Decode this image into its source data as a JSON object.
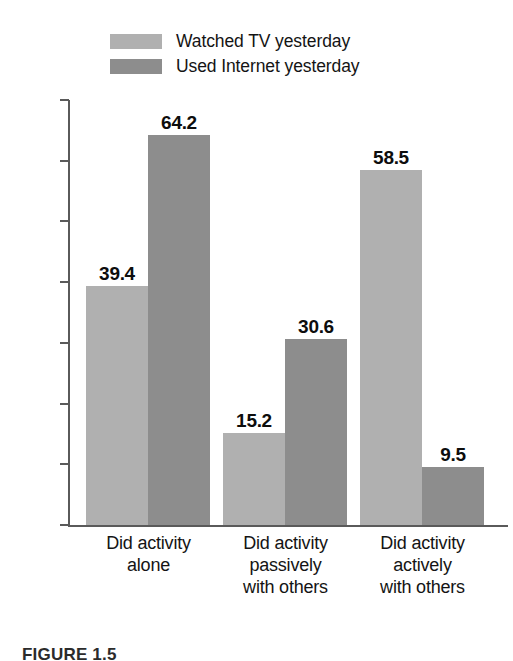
{
  "chart_data": {
    "type": "bar",
    "title": "",
    "subtitle": "",
    "xlabel": "",
    "ylabel": "",
    "ylim": [
      0,
      70
    ],
    "ytick_step": 10,
    "ytick_labels": [
      "0%",
      "10%",
      "20%",
      "30%",
      "40%",
      "50%",
      "60%",
      "70%"
    ],
    "ytick_values": [
      0,
      10,
      20,
      30,
      40,
      50,
      60,
      70
    ],
    "grid": false,
    "legend_position": "top",
    "categories": [
      "Did activity\nalone",
      "Did activity\npassively\nwith others",
      "Did activity\nactively\nwith others"
    ],
    "category_lines": [
      [
        "Did activity",
        "alone"
      ],
      [
        "Did activity",
        "passively",
        "with others"
      ],
      [
        "Did activity",
        "actively",
        "with others"
      ]
    ],
    "series": [
      {
        "name": "Watched TV yesterday",
        "color": "#b0b0b0",
        "values": [
          39.4,
          15.2,
          58.5
        ],
        "value_labels": [
          "39.4",
          "15.2",
          "58.5"
        ]
      },
      {
        "name": "Used Internet yesterday",
        "color": "#8d8d8d",
        "values": [
          64.2,
          30.6,
          9.5
        ],
        "value_labels": [
          "64.2",
          "30.6",
          "9.5"
        ]
      }
    ]
  },
  "legend": {
    "items": [
      {
        "label": "Watched TV yesterday",
        "color": "#b0b0b0"
      },
      {
        "label": "Used Internet yesterday",
        "color": "#8d8d8d"
      }
    ]
  },
  "axis": {
    "y_labels": [
      "70%",
      "60%",
      "50%",
      "40%",
      "30%",
      "20%",
      "10%",
      "0%"
    ]
  },
  "caption": {
    "text": "FIGURE 1.5"
  }
}
